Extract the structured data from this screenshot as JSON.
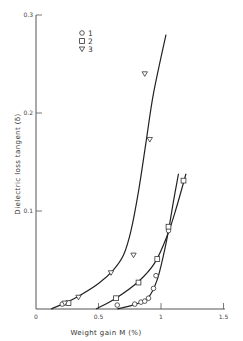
{
  "chart_data": {
    "type": "scatter",
    "title": "",
    "xlabel": "Weight gain M (%)",
    "ylabel": "Dielectric loss tangent (δ)",
    "xlim": [
      0,
      1.5
    ],
    "ylim": [
      0,
      0.3
    ],
    "x_ticks": [
      0,
      0.5,
      1,
      1.5
    ],
    "x_tick_labels": [
      "0",
      "0.5",
      "1",
      "1.5"
    ],
    "y_ticks": [
      0.1,
      0.2,
      0.3
    ],
    "y_tick_labels": [
      "0.1",
      "0.2",
      "0.3"
    ],
    "grid": false,
    "legend_position": "top-right",
    "series": [
      {
        "name": "1",
        "marker": "circle",
        "points": [
          [
            0.21,
            0.005
          ],
          [
            0.65,
            0.004
          ],
          [
            0.79,
            0.005
          ],
          [
            0.84,
            0.007
          ],
          [
            0.87,
            0.008
          ],
          [
            0.9,
            0.011
          ],
          [
            0.94,
            0.021
          ],
          [
            0.96,
            0.034
          ],
          [
            1.06,
            0.08
          ]
        ],
        "curve": [
          [
            0.65,
            0.0
          ],
          [
            0.8,
            0.005
          ],
          [
            0.9,
            0.012
          ],
          [
            0.97,
            0.03
          ],
          [
            1.02,
            0.055
          ],
          [
            1.06,
            0.08
          ],
          [
            1.1,
            0.11
          ],
          [
            1.14,
            0.138
          ]
        ]
      },
      {
        "name": "2",
        "marker": "square",
        "points": [
          [
            0.26,
            0.006
          ],
          [
            0.64,
            0.011
          ],
          [
            0.82,
            0.027
          ],
          [
            0.97,
            0.051
          ],
          [
            1.06,
            0.084
          ],
          [
            1.18,
            0.131
          ]
        ],
        "curve": [
          [
            0.48,
            0.0
          ],
          [
            0.64,
            0.011
          ],
          [
            0.82,
            0.028
          ],
          [
            0.95,
            0.047
          ],
          [
            1.05,
            0.075
          ],
          [
            1.12,
            0.102
          ],
          [
            1.2,
            0.138
          ]
        ]
      },
      {
        "name": "3",
        "marker": "triangle-down",
        "points": [
          [
            0.23,
            0.006
          ],
          [
            0.34,
            0.012
          ],
          [
            0.6,
            0.037
          ],
          [
            0.78,
            0.055
          ],
          [
            0.91,
            0.173
          ],
          [
            0.87,
            0.24
          ]
        ],
        "curve": [
          [
            0.12,
            0.0
          ],
          [
            0.23,
            0.006
          ],
          [
            0.34,
            0.013
          ],
          [
            0.5,
            0.026
          ],
          [
            0.62,
            0.04
          ],
          [
            0.7,
            0.055
          ],
          [
            0.76,
            0.08
          ],
          [
            0.82,
            0.12
          ],
          [
            0.88,
            0.17
          ],
          [
            0.94,
            0.22
          ],
          [
            1.04,
            0.28
          ]
        ]
      }
    ],
    "legend": [
      {
        "marker": "circle",
        "label": "1"
      },
      {
        "marker": "square",
        "label": "2"
      },
      {
        "marker": "triangle-down",
        "label": "3"
      }
    ]
  }
}
